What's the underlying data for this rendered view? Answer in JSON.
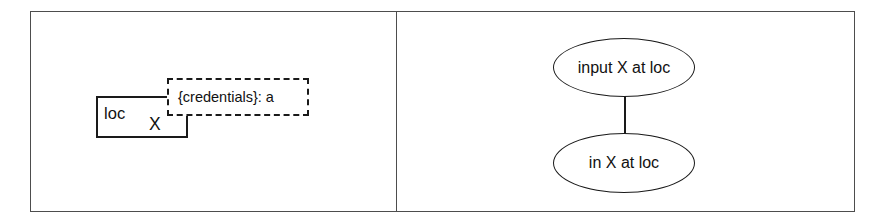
{
  "figure": {
    "panels": [
      {
        "id": "left",
        "name": "object-with-credentials-note",
        "object": {
          "label_primary": "loc",
          "label_secondary": "X"
        },
        "note": {
          "text": "{credentials}: a"
        }
      },
      {
        "id": "right",
        "name": "state-transition",
        "states": [
          {
            "label": "input X at loc"
          },
          {
            "label": "in X at loc"
          }
        ],
        "connector": {
          "from": "input X at loc",
          "to": "in X at loc"
        }
      }
    ],
    "style": {
      "frame_color": "#4d4d4d",
      "ink_color": "#1a1a1a",
      "text_color": "#111111",
      "background": "#ffffff"
    }
  }
}
